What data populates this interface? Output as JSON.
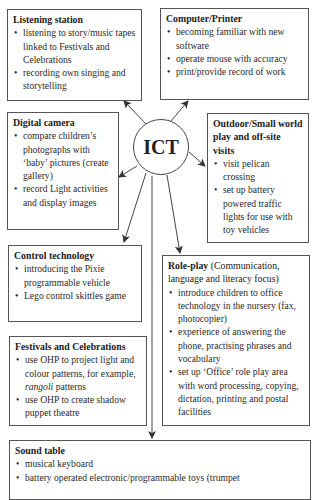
{
  "center": {
    "label": "ICT"
  },
  "boxes": {
    "listening": {
      "title": "Listening station",
      "items": [
        "listening to story/music tapes linked to Festivals and Celebrations",
        "recording own singing and storytelling"
      ]
    },
    "computer": {
      "title": "Computer/Printer",
      "items": [
        "becoming familiar with new software",
        "operate mouse with accuracy",
        "print/provide record of work"
      ]
    },
    "camera": {
      "title": "Digital camera",
      "items": [
        "compare children’s photographs with ‘baby’ pictures (create gallery)",
        "record Light activities and display images"
      ]
    },
    "outdoor": {
      "title": "Outdoor/Small world play and off-site visits",
      "items": [
        "visit pelican crossing",
        "set up battery powered traffic lights for use with toy vehicles"
      ]
    },
    "control": {
      "title": "Control technology",
      "items": [
        "introducing the Pixie programmable vehicle",
        "Lego control skittles game"
      ]
    },
    "roleplay": {
      "title": "Role-play",
      "subtitle": " (Communication, language and literacy focus)",
      "items": [
        "introduce children to office technology in the nursery (fax, photocopier)",
        "experience of answering the phone, practising phrases and vocabulary",
        "set up ‘Office’ role play area with word processing, copying, dictation, printing and postal facilities"
      ]
    },
    "festivals": {
      "title": "Festivals and Celebrations",
      "items": [
        "use OHP to project light and colour patterns, for example, ",
        "use OHP to create shadow puppet theatre"
      ],
      "item0_italic": "rangoli",
      "item0_tail": " patterns"
    },
    "sound": {
      "title": "Sound table",
      "items": [
        "musical keyboard",
        "battery operated electronic/programmable toys (trumpet"
      ]
    }
  }
}
